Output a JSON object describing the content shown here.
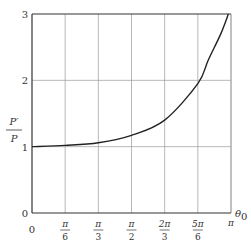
{
  "chart_data": {
    "type": "line",
    "title": "",
    "xlabel": "θ0",
    "ylabel": "P′/P",
    "xlim": [
      0,
      3.14159
    ],
    "ylim": [
      0,
      3
    ],
    "grid": true,
    "legend": null,
    "x_ticks": [
      {
        "value": 0,
        "num": "0",
        "den": ""
      },
      {
        "value": 0.5236,
        "num": "π",
        "den": "6"
      },
      {
        "value": 1.0472,
        "num": "π",
        "den": "3"
      },
      {
        "value": 1.5708,
        "num": "π",
        "den": "2"
      },
      {
        "value": 2.0944,
        "num": "2π",
        "den": "3"
      },
      {
        "value": 2.618,
        "num": "5π",
        "den": "6"
      },
      {
        "value": 3.1416,
        "num": "π",
        "den": ""
      }
    ],
    "y_ticks": [
      "0",
      "1",
      "2",
      "3"
    ],
    "series": [
      {
        "name": "P′/P",
        "x": [
          0,
          0.5236,
          1.0472,
          1.5708,
          2.0944,
          2.618,
          2.78,
          2.98,
          3.1
        ],
        "y": [
          1.0,
          1.02,
          1.06,
          1.17,
          1.4,
          1.95,
          2.3,
          2.7,
          3.0
        ]
      }
    ]
  },
  "labels": {
    "y_axis_num": "P′",
    "y_axis_den": "P",
    "x_axis": "θ",
    "x_axis_sub": "0",
    "origin_x": "0",
    "origin_y": "0"
  },
  "colors": {
    "axis": "#333333",
    "grid": "#9a9a9a",
    "curve": "#222222"
  }
}
